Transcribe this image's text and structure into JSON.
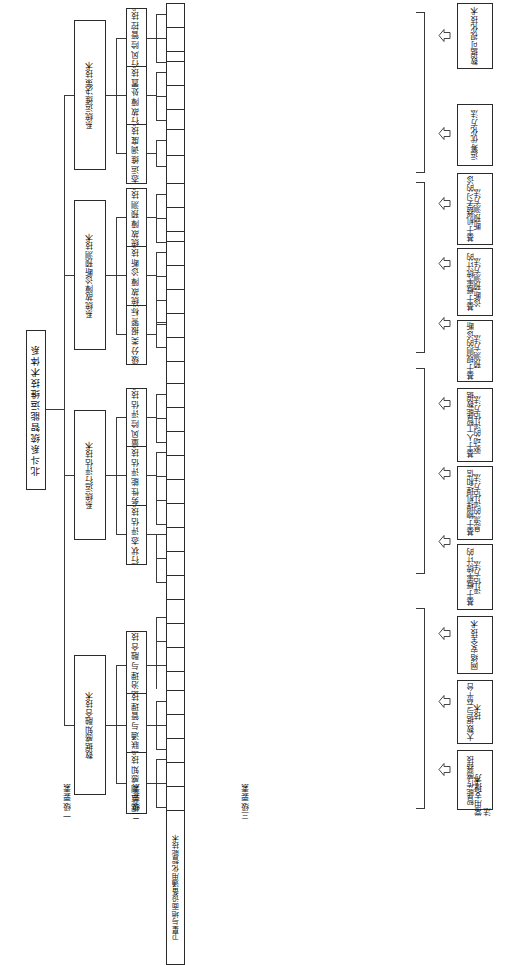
{
  "diagram": {
    "title": "北斗系统智能运维技术体系",
    "type": "tree",
    "orientation": "vertical-text-right-to-left",
    "captions": {
      "level1": "一级要素",
      "level2": "二级要素",
      "level3": "三级要素",
      "support": "常用支撑方法"
    },
    "colors": {
      "line": "#3a3a3a",
      "border": "#2b2b2b",
      "background": "#ffffff"
    },
    "level1": [
      {
        "label": "系统运维决策技术"
      },
      {
        "label": "系统故障诊断预测技术"
      },
      {
        "label": "系统运行评估技术"
      },
      {
        "label": "数据感知融合技术"
      }
    ],
    "level2": [
      {
        "label": "运行风险管控技术"
      },
      {
        "label": "运行故障处置技术"
      },
      {
        "label": "常态运维调度技术"
      },
      {
        "label": "系统故障预测技术"
      },
      {
        "label": "系统故障诊断技术"
      },
      {
        "label": "分级分类报警标准"
      },
      {
        "label": "质量风险评估技术"
      },
      {
        "label": "服务性能评估技术"
      },
      {
        "label": "运行状态评估技术"
      },
      {
        "label": "数据治理与融合技术"
      },
      {
        "label": "数据联通与管理技术"
      },
      {
        "label": "数据监测感知技术"
      }
    ],
    "level3": [
      {
        "label": "地面系统风险分类管控"
      },
      {
        "label": "卫星系统风险分类管控"
      },
      {
        "label": "大系统风险分类管控"
      },
      {
        "label": "地面系统故障处置"
      },
      {
        "label": "基于地面支持的卫星故障处置"
      },
      {
        "label": "卫星自主故障处置"
      },
      {
        "label": "可视化运维"
      },
      {
        "label": "多系统联合运维调度"
      },
      {
        "label": "设备级寿命预测"
      },
      {
        "label": "地面系统寿命预测"
      },
      {
        "label": "卫星系统寿命预测"
      },
      {
        "label": "星间链路故障诊断"
      },
      {
        "label": "地面系统故障诊断"
      },
      {
        "label": "卫星系统故障诊断"
      },
      {
        "label": "服务级智能故障诊断"
      },
      {
        "label": "地面系统分级分类报警"
      },
      {
        "label": "卫星系统分级分类报警"
      },
      {
        "label": "质量问题综合分析"
      },
      {
        "label": "运行可靠性评估"
      },
      {
        "label": "运行风险评估"
      },
      {
        "label": "其他服务性能评估"
      },
      {
        "label": "SBAS评估"
      },
      {
        "label": "RDSS评估"
      },
      {
        "label": "PNT评估"
      },
      {
        "label": "星间链路运行状态监测评估"
      },
      {
        "label": "地面系统运行状态监测评估"
      },
      {
        "label": "卫星运行状态监测评估"
      },
      {
        "label": "数据共享中心"
      },
      {
        "label": "分析建模技术"
      },
      {
        "label": "数据清洗和预处理技术"
      },
      {
        "label": "网络和数据安全管理技术"
      },
      {
        "label": "云平台与大数据存储技术"
      },
      {
        "label": "网络管理技术"
      },
      {
        "label": "数据标校技术"
      },
      {
        "label": "卫星与地面设备智能监测技术"
      },
      {
        "label": "卫星与地面设备通用化智能技术"
      }
    ],
    "support": [
      {
        "label": "数据可视化技术"
      },
      {
        "label": "运筹优化方法"
      },
      {
        "label": "基于机器学习的诊断预测方法"
      },
      {
        "label": "基于概率统计的诊断预测方法"
      },
      {
        "label": "基于规则的诊断预测方法"
      },
      {
        "label": "基于人工智能数据驱动的评估方法"
      },
      {
        "label": "基于物理机理和信息流的评估方法"
      },
      {
        "label": "基于概率统计的评估方法"
      },
      {
        "label": "网络安全技术"
      },
      {
        "label": "大数据与云平台技术"
      },
      {
        "label": "智能传感器技术"
      }
    ]
  }
}
